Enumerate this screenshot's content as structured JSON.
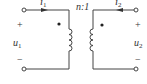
{
  "diagram": {
    "type": "ideal-transformer-circuit",
    "ratio_label": "n:1",
    "primary": {
      "current_label": "i",
      "current_sub": "1",
      "voltage_label": "u",
      "voltage_sub": "1",
      "plus": "+",
      "minus": "−"
    },
    "secondary": {
      "current_label": "i",
      "current_sub": "2",
      "voltage_label": "u",
      "voltage_sub": "2",
      "plus": "+",
      "minus": "−"
    },
    "colors": {
      "line": "#444444",
      "text": "#333333",
      "background": "#ffffff"
    }
  }
}
